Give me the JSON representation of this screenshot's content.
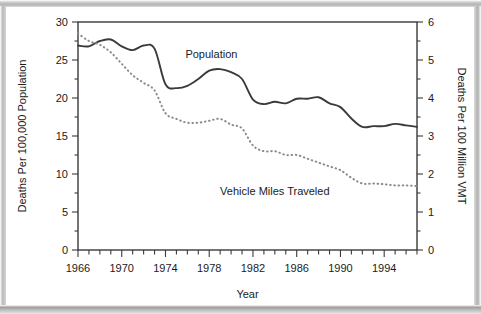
{
  "figure": {
    "background_color": "#ffffff",
    "frame_color": "#b4b4b4",
    "line_color": "#3a3a3a",
    "text_color": "#1b1b1b"
  },
  "chart_data": {
    "type": "line",
    "title": "",
    "xlabel": "Year",
    "ylabel": "Deaths Per 100,000 Population",
    "y2label": "Deaths Per 100 Million VMT",
    "grid": false,
    "legend_position": "inline-annotation",
    "xlim": [
      1966,
      1997
    ],
    "ylim": [
      0,
      30
    ],
    "y2lim": [
      0,
      6
    ],
    "x_major_ticks": [
      1966,
      1970,
      1974,
      1978,
      1982,
      1986,
      1990,
      1994
    ],
    "x_tick_labels": [
      "1966",
      "1970",
      "1974",
      "1978",
      "1982",
      "1986",
      "1990",
      "1994"
    ],
    "x_minor_tick_step": 1,
    "y_major_ticks": [
      0,
      5,
      10,
      15,
      20,
      25,
      30
    ],
    "y_tick_labels": [
      "0",
      "5",
      "10",
      "15",
      "20",
      "25",
      "30"
    ],
    "y_minor_tick_step": 2.5,
    "y2_major_ticks": [
      0,
      1,
      2,
      3,
      4,
      5,
      6
    ],
    "y2_tick_labels": [
      "0",
      "1",
      "2",
      "3",
      "4",
      "5",
      "6"
    ],
    "y2_minor_tick_step": 0.5,
    "x": [
      1966,
      1967,
      1968,
      1969,
      1970,
      1971,
      1972,
      1973,
      1974,
      1975,
      1976,
      1977,
      1978,
      1979,
      1980,
      1981,
      1982,
      1983,
      1984,
      1985,
      1986,
      1987,
      1988,
      1989,
      1990,
      1991,
      1992,
      1993,
      1994,
      1995,
      1996,
      1997
    ],
    "series": [
      {
        "name": "Population",
        "axis": "left",
        "style": "solid",
        "color": "#3a3a3a",
        "label_text": "Population",
        "values": [
          26.9,
          26.8,
          27.5,
          27.7,
          26.8,
          26.3,
          26.9,
          26.5,
          21.8,
          21.3,
          21.6,
          22.5,
          23.6,
          23.8,
          23.4,
          22.5,
          19.8,
          19.2,
          19.5,
          19.3,
          19.9,
          19.9,
          20.1,
          19.3,
          18.8,
          17.3,
          16.2,
          16.3,
          16.3,
          16.6,
          16.4,
          16.2
        ]
      },
      {
        "name": "Vehicle Miles Traveled",
        "axis": "right",
        "style": "dotted",
        "color": "#8c8c8c",
        "label_text": "Vehicle Miles Traveled",
        "values": [
          5.7,
          5.5,
          5.4,
          5.2,
          4.9,
          4.6,
          4.4,
          4.2,
          3.6,
          3.45,
          3.35,
          3.35,
          3.4,
          3.45,
          3.3,
          3.2,
          2.75,
          2.6,
          2.6,
          2.5,
          2.5,
          2.4,
          2.3,
          2.2,
          2.1,
          1.9,
          1.75,
          1.75,
          1.73,
          1.7,
          1.7,
          1.68
        ]
      }
    ],
    "annotations": [
      {
        "name": "population-label",
        "text": "Population",
        "x": 1978.2,
        "y": 25.2
      },
      {
        "name": "vmt-label",
        "text": "Vehicle Miles Traveled",
        "x": 1984.0,
        "y": 7.3
      }
    ]
  }
}
